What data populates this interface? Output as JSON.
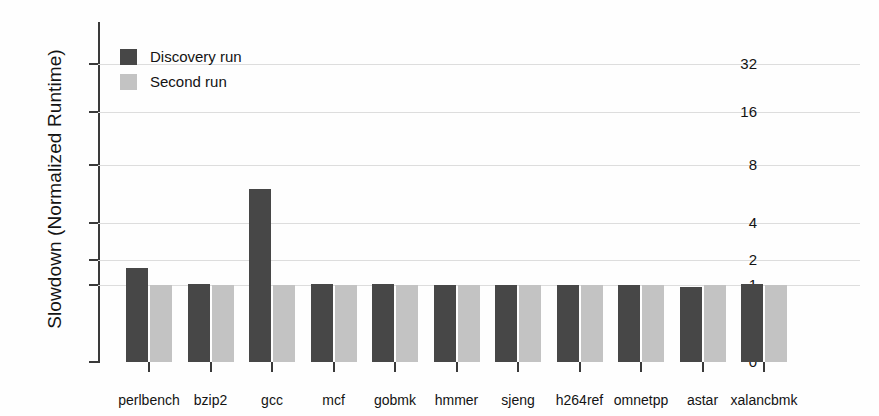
{
  "chart_data": {
    "type": "bar",
    "title": "",
    "xlabel": "",
    "ylabel": "Slowdown (Normalized Runtime)",
    "categories": [
      "perlbench",
      "bzip2",
      "gcc",
      "mcf",
      "gobmk",
      "hmmer",
      "sjeng",
      "h264ref",
      "omnetpp",
      "astar",
      "xalancbmk"
    ],
    "series": [
      {
        "name": "Discovery run",
        "color": "#474747",
        "values": [
          1.6,
          1.02,
          6.0,
          1.02,
          1.03,
          1.0,
          1.0,
          1.01,
          1.0,
          0.97,
          1.02
        ]
      },
      {
        "name": "Second run",
        "color": "#c3c3c3",
        "values": [
          1.0,
          1.01,
          1.0,
          1.0,
          1.0,
          1.0,
          1.0,
          1.0,
          1.0,
          1.0,
          1.0
        ]
      }
    ],
    "yticks": [
      0,
      1,
      2,
      4,
      8,
      16,
      32
    ],
    "ytick_labels": [
      "0",
      "1",
      "2",
      "4",
      "8",
      "16",
      "32"
    ],
    "yscale": "log-like (0,1,2,4,8,16,32 evenly-ish spaced)",
    "ylim": [
      0,
      45
    ],
    "grid": true,
    "legend_position": "top-left"
  },
  "axis": {
    "y_title": "Slowdown (Normalized Runtime)"
  },
  "legend": {
    "entries": [
      {
        "label": "Discovery run",
        "swatch": "dark-swatch"
      },
      {
        "label": "Second run",
        "swatch": "light-swatch"
      }
    ]
  }
}
